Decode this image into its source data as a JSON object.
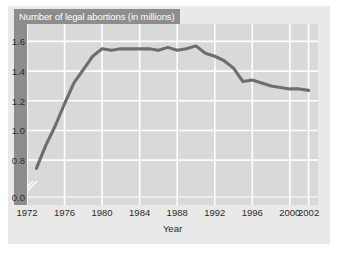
{
  "chart_data": {
    "type": "line",
    "title": "Number of legal abortions (in millions)",
    "xlabel": "Year",
    "ylabel": "",
    "xlim": [
      1972,
      2003
    ],
    "ylim": [
      0.7,
      1.65
    ],
    "grid": true,
    "legend": null,
    "axis_break": {
      "axis": "y",
      "note": "break between 0.0 and 0.8"
    },
    "xticks": [
      1972,
      1976,
      1980,
      1984,
      1988,
      1992,
      1996,
      2000,
      2002
    ],
    "xtick_labels": [
      "1972",
      "1976",
      "1980",
      "1984",
      "1988",
      "1992",
      "1996",
      "2000",
      "2002"
    ],
    "yticks": [
      0.0,
      0.8,
      1.0,
      1.2,
      1.4,
      1.6
    ],
    "ytick_labels": [
      "0.0",
      "0.8",
      "1.0",
      "1.2",
      "1.4",
      "1.6"
    ],
    "line_color": "#6e6e6e",
    "plot_background": "#d9d9d9",
    "gridline_color": "#ffffff",
    "banner_color": "#8d8d8d",
    "series": [
      {
        "name": "Legal abortions (millions)",
        "x": [
          1973,
          1974,
          1975,
          1976,
          1977,
          1978,
          1979,
          1980,
          1981,
          1982,
          1983,
          1984,
          1985,
          1986,
          1987,
          1988,
          1989,
          1990,
          1991,
          1992,
          1993,
          1994,
          1995,
          1996,
          1997,
          1998,
          1999,
          2000,
          2001,
          2002
        ],
        "values": [
          0.745,
          0.9,
          1.03,
          1.18,
          1.32,
          1.41,
          1.5,
          1.55,
          1.54,
          1.55,
          1.55,
          1.55,
          1.55,
          1.54,
          1.56,
          1.54,
          1.55,
          1.57,
          1.52,
          1.5,
          1.47,
          1.42,
          1.33,
          1.34,
          1.32,
          1.3,
          1.29,
          1.28,
          1.28,
          1.27
        ]
      }
    ]
  }
}
